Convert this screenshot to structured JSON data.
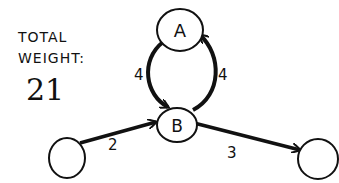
{
  "caption": {
    "line1": "TOTAL",
    "line2": "WEIGHT:",
    "value": "21"
  },
  "nodes": [
    {
      "id": "A",
      "label": "A",
      "cx": 180,
      "cy": 30,
      "r": 22
    },
    {
      "id": "B",
      "label": "B",
      "cx": 177,
      "cy": 126,
      "r": 20
    },
    {
      "id": "left",
      "label": "",
      "cx": 67,
      "cy": 157,
      "r": 20
    },
    {
      "id": "right",
      "label": "",
      "cx": 318,
      "cy": 159,
      "r": 20
    }
  ],
  "edges": [
    {
      "from": "A",
      "to": "B",
      "weight": "4"
    },
    {
      "from": "B",
      "to": "A",
      "weight": "4"
    },
    {
      "from": "left",
      "to": "B",
      "weight": "2"
    },
    {
      "from": "B",
      "to": "right",
      "weight": "3"
    }
  ],
  "colors": {
    "ink": "#111111",
    "paper": "#ffffff"
  }
}
